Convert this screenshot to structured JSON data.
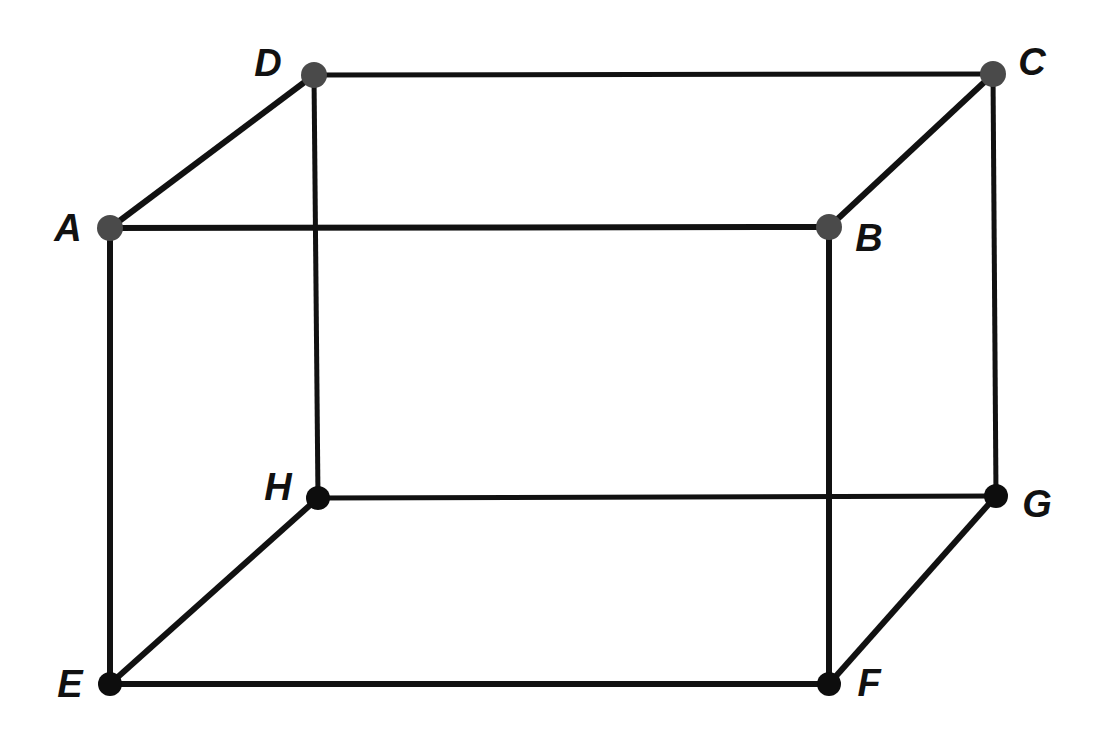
{
  "figure": {
    "background_color": "#ffffff",
    "canvas": {
      "width": 1104,
      "height": 734
    }
  },
  "style": {
    "edge_color": "#111111",
    "edge_width_front": 6,
    "edge_width_back": 5,
    "vertex_color_top": "#4a4a4a",
    "vertex_color_bottom": "#0d0d0d",
    "vertex_radius_top": 13,
    "vertex_radius_bottom": 12,
    "label_color": "#111111",
    "label_font_size": 38
  },
  "vertices": [
    {
      "id": "A",
      "label": "A",
      "x": 110,
      "y": 228,
      "label_x": 68,
      "label_y": 228,
      "face": "front-top-left",
      "dot_style": "gray"
    },
    {
      "id": "B",
      "label": "B",
      "x": 829,
      "y": 227,
      "label_x": 869,
      "label_y": 238,
      "face": "front-top-right",
      "dot_style": "gray"
    },
    {
      "id": "C",
      "label": "C",
      "x": 993,
      "y": 74,
      "label_x": 1032,
      "label_y": 62,
      "face": "back-top-right",
      "dot_style": "gray"
    },
    {
      "id": "D",
      "label": "D",
      "x": 314,
      "y": 75,
      "label_x": 268,
      "label_y": 63,
      "face": "back-top-left",
      "dot_style": "gray"
    },
    {
      "id": "E",
      "label": "E",
      "x": 110,
      "y": 684,
      "label_x": 70,
      "label_y": 684,
      "face": "front-bottom-left",
      "dot_style": "black"
    },
    {
      "id": "F",
      "label": "F",
      "x": 829,
      "y": 684,
      "label_x": 869,
      "label_y": 683,
      "face": "front-bottom-right",
      "dot_style": "black"
    },
    {
      "id": "G",
      "label": "G",
      "x": 996,
      "y": 496,
      "label_x": 1037,
      "label_y": 504,
      "face": "back-bottom-right",
      "dot_style": "black"
    },
    {
      "id": "H",
      "label": "H",
      "x": 318,
      "y": 498,
      "label_x": 278,
      "label_y": 487,
      "face": "back-bottom-left",
      "dot_style": "black"
    }
  ],
  "edges": [
    {
      "id": "AB",
      "from": "A",
      "to": "B",
      "kind": "front-top"
    },
    {
      "id": "BF",
      "from": "B",
      "to": "F",
      "kind": "front-right"
    },
    {
      "id": "FE",
      "from": "F",
      "to": "E",
      "kind": "front-bottom"
    },
    {
      "id": "EA",
      "from": "E",
      "to": "A",
      "kind": "front-left"
    },
    {
      "id": "DC",
      "from": "D",
      "to": "C",
      "kind": "back-top"
    },
    {
      "id": "CG",
      "from": "C",
      "to": "G",
      "kind": "back-right"
    },
    {
      "id": "GH",
      "from": "G",
      "to": "H",
      "kind": "back-bottom"
    },
    {
      "id": "HD",
      "from": "H",
      "to": "D",
      "kind": "back-left"
    },
    {
      "id": "AD",
      "from": "A",
      "to": "D",
      "kind": "depth-top-left"
    },
    {
      "id": "BC",
      "from": "B",
      "to": "C",
      "kind": "depth-top-right"
    },
    {
      "id": "FG",
      "from": "F",
      "to": "G",
      "kind": "depth-bottom-right"
    },
    {
      "id": "EH",
      "from": "E",
      "to": "H",
      "kind": "depth-bottom-left"
    }
  ]
}
